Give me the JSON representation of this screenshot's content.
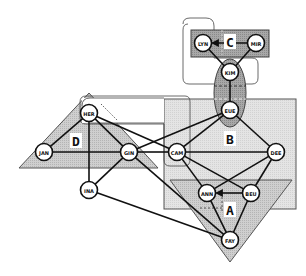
{
  "groups": [
    {
      "id": "A",
      "label": "A"
    },
    {
      "id": "B",
      "label": "B"
    },
    {
      "id": "C",
      "label": "C"
    },
    {
      "id": "D",
      "label": "D"
    }
  ],
  "nodes": [
    {
      "id": "LYN",
      "label": "LYN"
    },
    {
      "id": "MIR",
      "label": "MIR"
    },
    {
      "id": "KIM",
      "label": "KIM"
    },
    {
      "id": "EUE",
      "label": "EUE"
    },
    {
      "id": "HER",
      "label": "HER"
    },
    {
      "id": "JAN",
      "label": "JAN"
    },
    {
      "id": "GIN",
      "label": "GIN"
    },
    {
      "id": "INA",
      "label": "INA"
    },
    {
      "id": "CAM",
      "label": "CAM"
    },
    {
      "id": "DEE",
      "label": "DEE"
    },
    {
      "id": "ANN",
      "label": "ANN"
    },
    {
      "id": "BEU",
      "label": "BEU"
    },
    {
      "id": "FAY",
      "label": "FAY"
    }
  ],
  "edges": [
    {
      "from": "MIR",
      "to": "LYN",
      "style": "arrow"
    },
    {
      "from": "LYN",
      "to": "KIM",
      "style": "solid"
    },
    {
      "from": "MIR",
      "to": "KIM",
      "style": "solid"
    },
    {
      "from": "KIM",
      "to": "EUE",
      "style": "solid"
    },
    {
      "from": "EUE",
      "to": "GIN",
      "style": "solid"
    },
    {
      "from": "EUE",
      "to": "CAM",
      "style": "solid"
    },
    {
      "from": "EUE",
      "to": "DEE",
      "style": "solid"
    },
    {
      "from": "HER",
      "to": "JAN",
      "style": "solid"
    },
    {
      "from": "HER",
      "to": "GIN",
      "style": "solid"
    },
    {
      "from": "HER",
      "to": "INA",
      "style": "solid"
    },
    {
      "from": "HER",
      "to": "CAM",
      "style": "solid"
    },
    {
      "from": "JAN",
      "to": "GIN",
      "style": "solid"
    },
    {
      "from": "GIN",
      "to": "CAM",
      "style": "solid"
    },
    {
      "from": "GIN",
      "to": "INA",
      "style": "solid"
    },
    {
      "from": "GIN",
      "to": "FAY",
      "style": "solid"
    },
    {
      "from": "INA",
      "to": "FAY",
      "style": "solid"
    },
    {
      "from": "CAM",
      "to": "DEE",
      "style": "solid"
    },
    {
      "from": "CAM",
      "to": "ANN",
      "style": "solid"
    },
    {
      "from": "CAM",
      "to": "BEU",
      "style": "solid"
    },
    {
      "from": "DEE",
      "to": "ANN",
      "style": "solid"
    },
    {
      "from": "DEE",
      "to": "BEU",
      "style": "solid"
    },
    {
      "from": "BEU",
      "to": "ANN",
      "style": "arrow"
    },
    {
      "from": "ANN",
      "to": "FAY",
      "style": "solid"
    },
    {
      "from": "BEU",
      "to": "FAY",
      "style": "solid"
    }
  ]
}
